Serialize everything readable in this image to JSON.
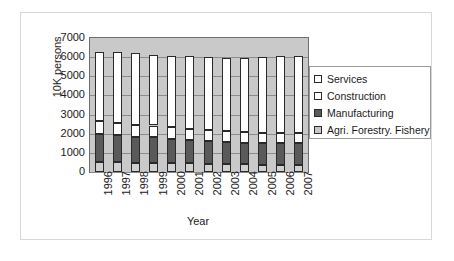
{
  "chart_data": {
    "type": "bar",
    "stacked": true,
    "title": "",
    "xlabel": "Year",
    "ylabel": "10K persons",
    "ylim": [
      0,
      7000
    ],
    "ytick_step": 1000,
    "yticks": [
      "7000",
      "6000",
      "5000",
      "4000",
      "3000",
      "2000",
      "1000",
      "0"
    ],
    "grid": true,
    "legend_position": "right",
    "categories": [
      "1996",
      "1997",
      "1998",
      "1999",
      "2000",
      "2001",
      "2002",
      "2003",
      "2004",
      "2005",
      "2006",
      "2007"
    ],
    "series": [
      {
        "name": "Agri. Forestry. Fishery",
        "color": "#d0d0d0",
        "values": [
          520,
          520,
          490,
          480,
          460,
          450,
          430,
          410,
          400,
          390,
          380,
          370
        ]
      },
      {
        "name": "Manufacturing",
        "color": "#5a5a5a",
        "values": [
          1450,
          1390,
          1330,
          1330,
          1250,
          1230,
          1180,
          1170,
          1130,
          1130,
          1150,
          1150
        ]
      },
      {
        "name": "Construction",
        "color": "#ffffff",
        "values": [
          670,
          660,
          630,
          620,
          620,
          560,
          570,
          580,
          560,
          530,
          530,
          520
        ]
      },
      {
        "name": "Services",
        "color": "#ffffff",
        "values": [
          3640,
          3690,
          3750,
          3670,
          3740,
          3830,
          3820,
          3820,
          3890,
          3940,
          4000,
          4040
        ]
      }
    ],
    "totals": [
      6280,
      6260,
      6200,
      6100,
      6070,
      6070,
      6000,
      5980,
      5980,
      5990,
      6060,
      6080
    ],
    "legend_entries": [
      {
        "label": "Services",
        "swatch": "#ffffff"
      },
      {
        "label": "Construction",
        "swatch": "#ffffff"
      },
      {
        "label": "Manufacturing",
        "swatch": "#5a5a5a"
      },
      {
        "label": "Agri. Forestry. Fishery",
        "swatch": "#c8c8c8"
      }
    ],
    "plot_background": "#c9c9c9"
  }
}
